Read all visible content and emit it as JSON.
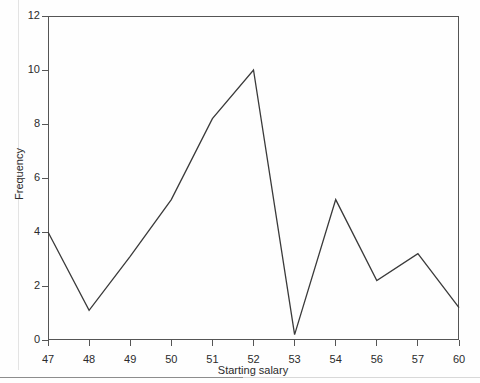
{
  "chart_data": {
    "type": "line",
    "title": "",
    "xlabel": "Starting salary",
    "ylabel": "Frequency",
    "categories": [
      "47",
      "48",
      "49",
      "50",
      "51",
      "52",
      "53",
      "54",
      "56",
      "57",
      "60"
    ],
    "values": [
      4.0,
      1.1,
      3.1,
      5.2,
      8.2,
      10.0,
      0.2,
      5.2,
      2.2,
      3.2,
      1.2
    ],
    "series": [
      {
        "name": "Frequency",
        "values": [
          4.0,
          1.1,
          3.1,
          5.2,
          8.2,
          10.0,
          0.2,
          5.2,
          2.2,
          3.2,
          1.2
        ]
      }
    ],
    "ylim": [
      0,
      12
    ],
    "xlim": [
      0,
      10
    ],
    "yticks": [
      "0",
      "2",
      "4",
      "6",
      "8",
      "10",
      "12"
    ],
    "ytick_values": [
      0,
      2,
      4,
      6,
      8,
      10,
      12
    ],
    "xticks": [
      "47",
      "48",
      "49",
      "50",
      "51",
      "52",
      "53",
      "54",
      "56",
      "57",
      "60"
    ],
    "grid": false,
    "legend": false,
    "legend_position": "none",
    "line_color": "#3a3a3a",
    "axis_color": "#555555",
    "background_color": "#fefefe"
  },
  "axes": {
    "x_title": "Starting salary",
    "y_title": "Frequency"
  }
}
